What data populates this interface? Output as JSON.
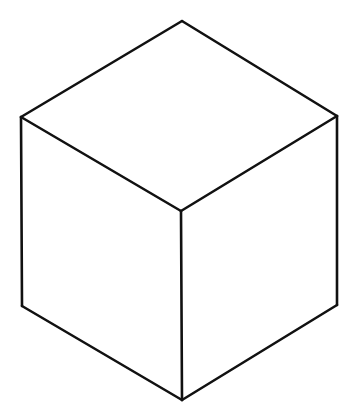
{
  "figure": {
    "type": "line-drawing",
    "canvas": {
      "width": 358,
      "height": 416,
      "background_color": "#ffffff"
    },
    "style": {
      "stroke_color": "#111111",
      "stroke_width": 2.6,
      "fill_color": "#ffffff"
    },
    "vertices": {
      "top_apex": [
        182,
        21
      ],
      "upper_left": [
        21,
        117
      ],
      "upper_right": [
        337,
        116
      ],
      "center": [
        181,
        211
      ],
      "lower_left": [
        22,
        306
      ],
      "lower_right": [
        337,
        305
      ],
      "bottom_apex": [
        182,
        400
      ]
    },
    "faces": [
      {
        "name": "top-face",
        "label": "Top face",
        "points": "182,21 337,116 181,211 21,117"
      },
      {
        "name": "left-face",
        "label": "Left face",
        "points": "21,117 181,211 182,400 22,306"
      },
      {
        "name": "right-face",
        "label": "Right face",
        "points": "181,211 337,116 337,305 182,400"
      }
    ],
    "edges": [
      {
        "name": "edge-top-apex-to-upper-right",
        "from": [
          182,
          21
        ],
        "to": [
          337,
          116
        ]
      },
      {
        "name": "edge-top-apex-to-upper-left",
        "from": [
          182,
          21
        ],
        "to": [
          21,
          117
        ]
      },
      {
        "name": "edge-upper-left-to-center",
        "from": [
          21,
          117
        ],
        "to": [
          181,
          211
        ]
      },
      {
        "name": "edge-upper-right-to-center",
        "from": [
          337,
          116
        ],
        "to": [
          181,
          211
        ]
      },
      {
        "name": "edge-upper-left-to-lower-left",
        "from": [
          21,
          117
        ],
        "to": [
          22,
          306
        ]
      },
      {
        "name": "edge-upper-right-to-lower-right",
        "from": [
          337,
          116
        ],
        "to": [
          337,
          305
        ]
      },
      {
        "name": "edge-center-to-bottom-apex",
        "from": [
          181,
          211
        ],
        "to": [
          182,
          400
        ]
      },
      {
        "name": "edge-lower-left-to-bottom-apex",
        "from": [
          22,
          306
        ],
        "to": [
          182,
          400
        ]
      },
      {
        "name": "edge-lower-right-to-bottom-apex",
        "from": [
          337,
          305
        ],
        "to": [
          182,
          400
        ]
      }
    ]
  }
}
